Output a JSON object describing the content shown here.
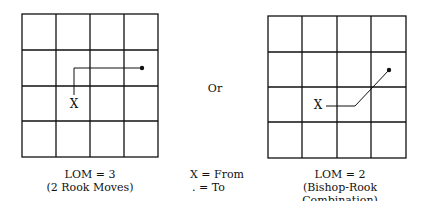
{
  "left_diagram": {
    "from_label": "X",
    "caption_line1": "LOM = 3",
    "caption_line2": "(2 Rook Moves)"
  },
  "middle": {
    "or_label": "Or",
    "legend_from": "X = From",
    "legend_to": ". = To"
  },
  "right_diagram": {
    "from_label": "X",
    "caption_line1": "LOM = 2",
    "caption_line2": "(Bishop-Rook Combination)"
  },
  "colors": {
    "line": "#111111",
    "background": "#ffffff"
  }
}
